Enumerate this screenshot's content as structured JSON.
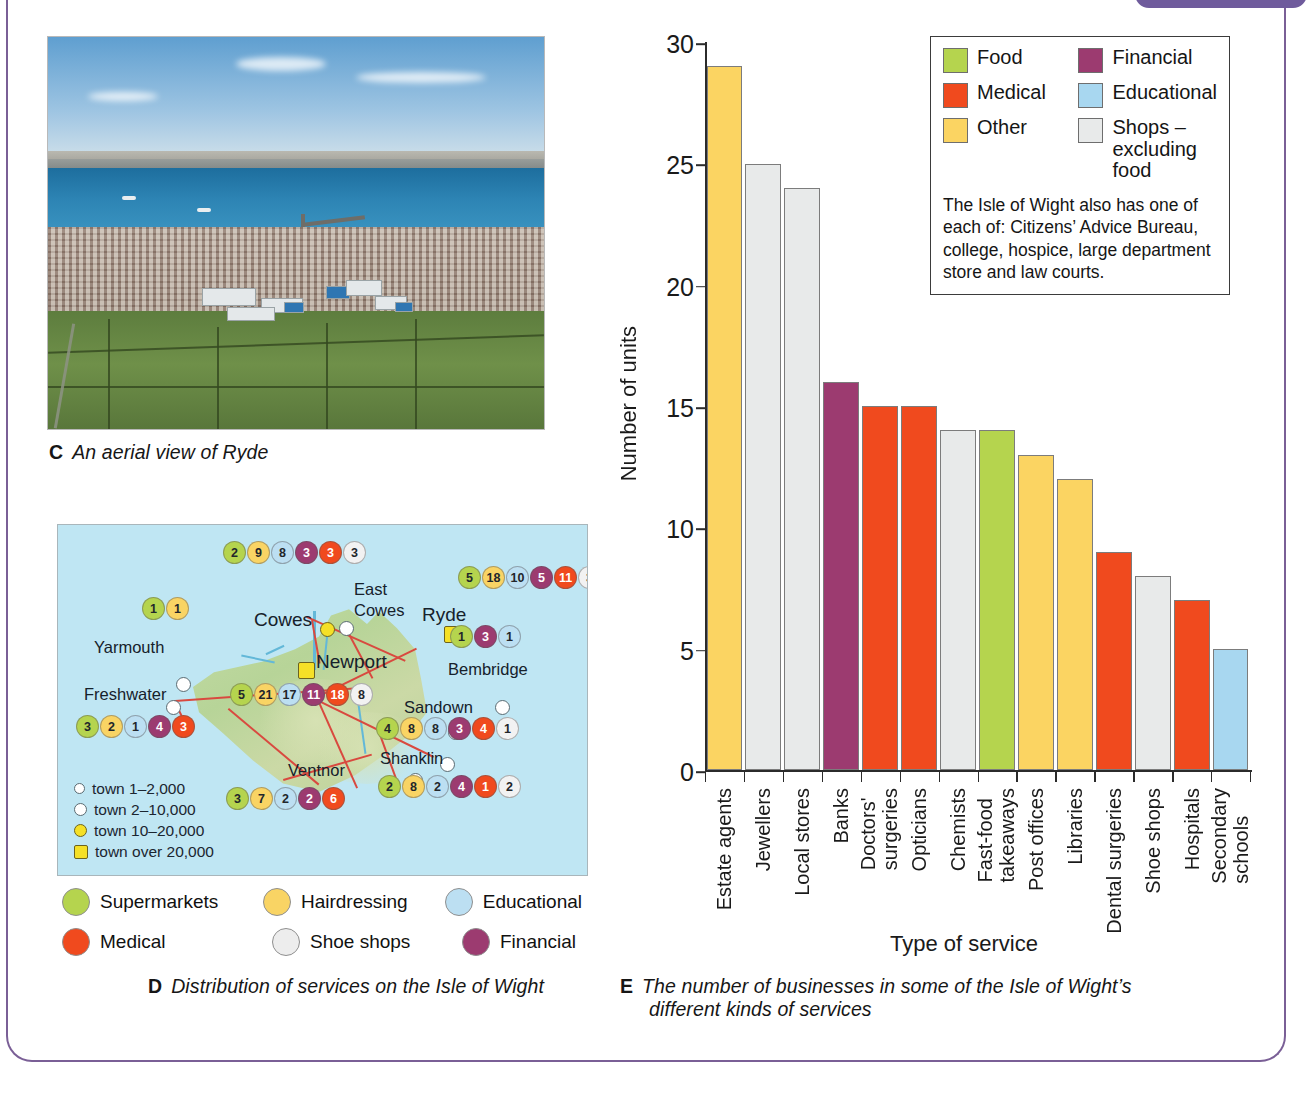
{
  "page": {
    "frame_color": "#7a5f96",
    "tab_color": "#6f5b9c"
  },
  "figures": {
    "c": {
      "label": "C",
      "caption": "An aerial view of Ryde",
      "alt": "aerial-photograph-of-ryde"
    },
    "d": {
      "label": "D",
      "caption": "Distribution of services on the Isle of Wight",
      "map": {
        "towns": [
          {
            "name": "Cowes",
            "size": "10-20,000"
          },
          {
            "name": "East Cowes",
            "size": "2-10,000"
          },
          {
            "name": "Yarmouth",
            "size": "1-2,000"
          },
          {
            "name": "Freshwater",
            "size": "2-10,000"
          },
          {
            "name": "Newport",
            "size": "over 20,000"
          },
          {
            "name": "Ryde",
            "size": "over 20,000"
          },
          {
            "name": "Bembridge",
            "size": "1-2,000"
          },
          {
            "name": "Sandown",
            "size": "2-10,000"
          },
          {
            "name": "Shanklin",
            "size": "2-10,000"
          },
          {
            "name": "Ventnor",
            "size": "2-10,000"
          }
        ],
        "service_clusters": [
          {
            "town": "Cowes",
            "values": [
              {
                "category": "Supermarkets",
                "value": "2",
                "color": "#b5d44e"
              },
              {
                "category": "Hairdressing",
                "value": "9",
                "color": "#f9d464"
              },
              {
                "category": "Educational",
                "value": "8",
                "color": "#bcdff2"
              },
              {
                "category": "Financial",
                "value": "3",
                "color": "#9c3b70"
              },
              {
                "category": "Medical",
                "value": "3",
                "color": "#f04a1e"
              },
              {
                "category": "Shoe shops",
                "value": "3",
                "color": "#f2f2f2"
              }
            ]
          },
          {
            "town": "Yarmouth",
            "values": [
              {
                "category": "Supermarkets",
                "value": "1",
                "color": "#b5d44e"
              },
              {
                "category": "Hairdressing",
                "value": "1",
                "color": "#f9d464"
              }
            ]
          },
          {
            "town": "Ryde",
            "values": [
              {
                "category": "Supermarkets",
                "value": "5",
                "color": "#b5d44e"
              },
              {
                "category": "Hairdressing",
                "value": "18",
                "color": "#f9d464"
              },
              {
                "category": "Educational",
                "value": "10",
                "color": "#bcdff2"
              },
              {
                "category": "Financial",
                "value": "5",
                "color": "#9c3b70"
              },
              {
                "category": "Medical",
                "value": "11",
                "color": "#f04a1e"
              },
              {
                "category": "Shoe shops",
                "value": "3",
                "color": "#f2f2f2"
              }
            ]
          },
          {
            "town": "Bembridge",
            "values": [
              {
                "category": "Supermarkets",
                "value": "1",
                "color": "#b5d44e"
              },
              {
                "category": "Financial",
                "value": "3",
                "color": "#9c3b70"
              },
              {
                "category": "Educational",
                "value": "1",
                "color": "#bcdff2"
              }
            ]
          },
          {
            "town": "Newport",
            "values": [
              {
                "category": "Supermarkets",
                "value": "5",
                "color": "#b5d44e"
              },
              {
                "category": "Hairdressing",
                "value": "21",
                "color": "#f9d464"
              },
              {
                "category": "Educational",
                "value": "17",
                "color": "#bcdff2"
              },
              {
                "category": "Financial",
                "value": "11",
                "color": "#9c3b70"
              },
              {
                "category": "Medical",
                "value": "18",
                "color": "#f04a1e"
              },
              {
                "category": "Shoe shops",
                "value": "8",
                "color": "#f2f2f2"
              }
            ]
          },
          {
            "town": "Freshwater",
            "values": [
              {
                "category": "Supermarkets",
                "value": "3",
                "color": "#b5d44e"
              },
              {
                "category": "Hairdressing",
                "value": "2",
                "color": "#f9d464"
              },
              {
                "category": "Educational",
                "value": "1",
                "color": "#bcdff2"
              },
              {
                "category": "Financial",
                "value": "4",
                "color": "#9c3b70"
              },
              {
                "category": "Medical",
                "value": "3",
                "color": "#f04a1e"
              }
            ]
          },
          {
            "town": "Sandown",
            "values": [
              {
                "category": "Supermarkets",
                "value": "4",
                "color": "#b5d44e"
              },
              {
                "category": "Hairdressing",
                "value": "8",
                "color": "#f9d464"
              },
              {
                "category": "Educational",
                "value": "8",
                "color": "#bcdff2"
              },
              {
                "category": "Financial",
                "value": "3",
                "color": "#9c3b70"
              },
              {
                "category": "Medical",
                "value": "4",
                "color": "#f04a1e"
              },
              {
                "category": "Shoe shops",
                "value": "1",
                "color": "#f2f2f2"
              }
            ]
          },
          {
            "town": "Ventnor",
            "values": [
              {
                "category": "Supermarkets",
                "value": "3",
                "color": "#b5d44e"
              },
              {
                "category": "Hairdressing",
                "value": "7",
                "color": "#f9d464"
              },
              {
                "category": "Educational",
                "value": "2",
                "color": "#bcdff2"
              },
              {
                "category": "Financial",
                "value": "2",
                "color": "#9c3b70"
              },
              {
                "category": "Medical",
                "value": "6",
                "color": "#f04a1e"
              }
            ]
          },
          {
            "town": "Shanklin",
            "values": [
              {
                "category": "Supermarkets",
                "value": "2",
                "color": "#b5d44e"
              },
              {
                "category": "Hairdressing",
                "value": "8",
                "color": "#f9d464"
              },
              {
                "category": "Educational",
                "value": "2",
                "color": "#bcdff2"
              },
              {
                "category": "Financial",
                "value": "4",
                "color": "#9c3b70"
              },
              {
                "category": "Medical",
                "value": "1",
                "color": "#f04a1e"
              },
              {
                "category": "Shoe shops",
                "value": "2",
                "color": "#f2f2f2"
              }
            ]
          }
        ],
        "town_key": [
          {
            "label": "town 1–2,000",
            "symbol": "small-open-circle"
          },
          {
            "label": "town 2–10,000",
            "symbol": "large-open-circle"
          },
          {
            "label": "town 10–20,000",
            "symbol": "yellow-circle"
          },
          {
            "label": "town over 20,000",
            "symbol": "yellow-square"
          }
        ],
        "legend": [
          {
            "label": "Supermarkets",
            "color": "#b5d44e"
          },
          {
            "label": "Hairdressing",
            "color": "#f9d464"
          },
          {
            "label": "Educational",
            "color": "#bcdff2"
          },
          {
            "label": "Medical",
            "color": "#f04a1e"
          },
          {
            "label": "Shoe shops",
            "color": "#ededed"
          },
          {
            "label": "Financial",
            "color": "#9c3b70"
          }
        ]
      }
    },
    "e": {
      "label": "E",
      "caption_line1": "The number of businesses in some of the Isle of Wight’s",
      "caption_line2": "different kinds of services",
      "legend": [
        {
          "label": "Food",
          "color": "#b5d44e"
        },
        {
          "label": "Financial",
          "color": "#9c3b70"
        },
        {
          "label": "Medical",
          "color": "#f04a1e"
        },
        {
          "label": "Educational",
          "color": "#a8d7f0"
        },
        {
          "label": "Other",
          "color": "#fbd462"
        },
        {
          "label": "Shops – excluding food",
          "color": "#e8eaea"
        }
      ],
      "note": "The Isle of Wight also has one of each of: Citizens’ Advice Bureau, college, hospice, large department store and law courts."
    }
  },
  "chart_data": {
    "type": "bar",
    "title": "",
    "xlabel": "Type of service",
    "ylabel": "Number of units",
    "ylim": [
      0,
      30
    ],
    "yticks": [
      0,
      5,
      10,
      15,
      20,
      25,
      30
    ],
    "grid": false,
    "legend_position": "top-right",
    "categories": [
      "Estate agents",
      "Jewellers",
      "Local stores",
      "Banks",
      "Doctors' surgeries",
      "Opticians",
      "Chemists",
      "Fast-food takeaways",
      "Post offices",
      "Libraries",
      "Dental surgeries",
      "Shoe shops",
      "Hospitals",
      "Secondary schools"
    ],
    "values": [
      29,
      25,
      24,
      16,
      15,
      15,
      14,
      14,
      13,
      12,
      9,
      8,
      7,
      5
    ],
    "bar_colors": [
      "#fbd462",
      "#e8eaea",
      "#e8eaea",
      "#9c3b70",
      "#f04a1e",
      "#f04a1e",
      "#e8eaea",
      "#b5d44e",
      "#fbd462",
      "#fbd462",
      "#f04a1e",
      "#e8eaea",
      "#f04a1e",
      "#a8d7f0"
    ],
    "bar_categories": [
      "Other",
      "Shops – excluding food",
      "Shops – excluding food",
      "Financial",
      "Medical",
      "Medical",
      "Shops – excluding food",
      "Food",
      "Other",
      "Other",
      "Medical",
      "Shops – excluding food",
      "Medical",
      "Educational"
    ]
  }
}
